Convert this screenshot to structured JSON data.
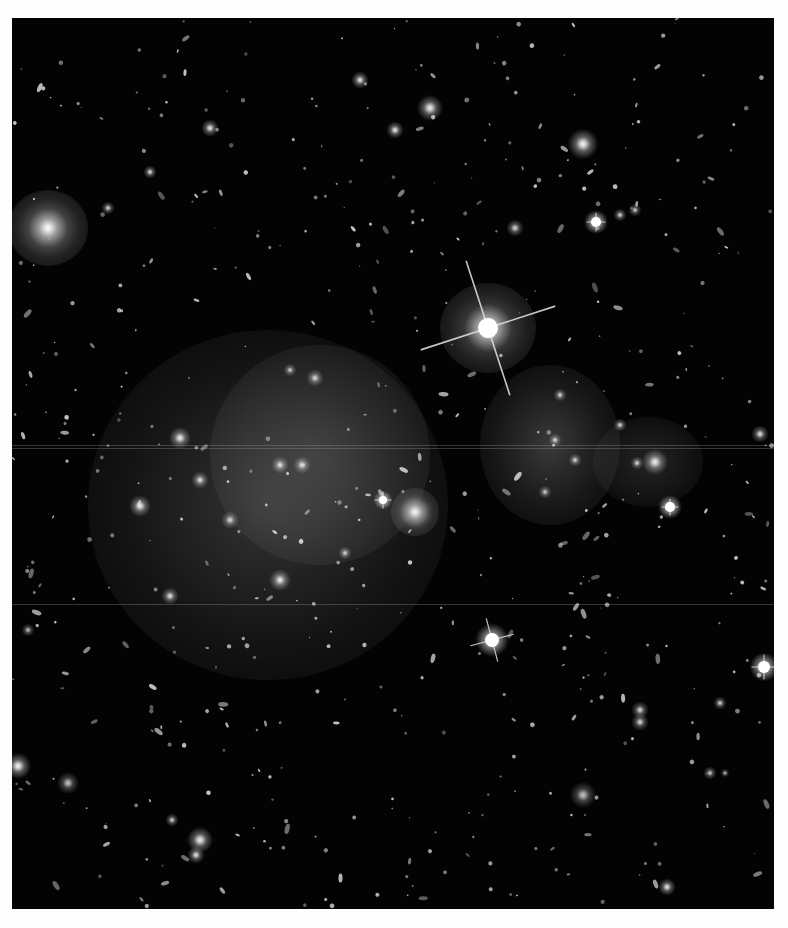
{
  "image": {
    "subject": "galaxy cluster deep-field photograph",
    "palette": "grayscale",
    "background_color": "#030303",
    "frame_color": "#fdfdfd",
    "bounds": {
      "left": 12,
      "top": 18,
      "width": 762,
      "height": 891
    }
  },
  "diffuse_glows": [
    {
      "name": "cluster-halo-left",
      "cx": 268,
      "cy": 505,
      "rx": 180,
      "ry": 175,
      "color": "rgba(120,120,120,0.42)"
    },
    {
      "name": "cluster-halo-left-core",
      "cx": 320,
      "cy": 455,
      "rx": 110,
      "ry": 110,
      "color": "rgba(140,140,140,0.30)"
    },
    {
      "name": "cluster-halo-right",
      "cx": 550,
      "cy": 445,
      "rx": 70,
      "ry": 80,
      "color": "rgba(140,140,140,0.40)"
    },
    {
      "name": "cluster-halo-far-right",
      "cx": 648,
      "cy": 462,
      "rx": 55,
      "ry": 45,
      "color": "rgba(110,110,110,0.30)"
    },
    {
      "name": "bright-star-halo",
      "cx": 488,
      "cy": 328,
      "rx": 48,
      "ry": 45,
      "color": "rgba(200,200,200,0.45)"
    },
    {
      "name": "galaxy-halo-left-edge",
      "cx": 48,
      "cy": 228,
      "rx": 40,
      "ry": 38,
      "color": "rgba(220,220,220,0.55)"
    },
    {
      "name": "galaxy-halo-center",
      "cx": 415,
      "cy": 512,
      "rx": 24,
      "ry": 24,
      "color": "rgba(210,210,210,0.55)"
    }
  ],
  "streaks": [
    {
      "y": 445
    },
    {
      "y": 448
    },
    {
      "y": 604
    }
  ],
  "spiked_stars": [
    {
      "name": "bright-star-main",
      "x": 488,
      "y": 328,
      "r": 10,
      "spike": 70,
      "angle": -18
    },
    {
      "name": "bright-star-lower",
      "x": 492,
      "y": 640,
      "r": 7,
      "spike": 22,
      "angle": -15
    },
    {
      "name": "bright-star-right-edge",
      "x": 764,
      "y": 667,
      "r": 6,
      "spike": 12,
      "angle": 0
    },
    {
      "name": "star-upper-right",
      "x": 596,
      "y": 222,
      "r": 5,
      "spike": 9,
      "angle": 0
    },
    {
      "name": "star-right-cluster",
      "x": 670,
      "y": 507,
      "r": 5,
      "spike": 8,
      "angle": 0
    },
    {
      "name": "star-cluster-mid",
      "x": 383,
      "y": 500,
      "r": 4,
      "spike": 8,
      "angle": 0
    }
  ],
  "bright_sources": [
    {
      "x": 48,
      "y": 228,
      "r": 9,
      "b": 1.0
    },
    {
      "x": 583,
      "y": 144,
      "r": 7,
      "b": 0.9
    },
    {
      "x": 415,
      "y": 512,
      "r": 7,
      "b": 0.9
    },
    {
      "x": 430,
      "y": 108,
      "r": 6,
      "b": 0.85
    },
    {
      "x": 360,
      "y": 80,
      "r": 4,
      "b": 0.8
    },
    {
      "x": 395,
      "y": 130,
      "r": 4,
      "b": 0.8
    },
    {
      "x": 210,
      "y": 128,
      "r": 4,
      "b": 0.8
    },
    {
      "x": 150,
      "y": 172,
      "r": 3,
      "b": 0.75
    },
    {
      "x": 108,
      "y": 208,
      "r": 3,
      "b": 0.7
    },
    {
      "x": 18,
      "y": 766,
      "r": 6,
      "b": 0.9
    },
    {
      "x": 68,
      "y": 783,
      "r": 5,
      "b": 0.6
    },
    {
      "x": 200,
      "y": 840,
      "r": 6,
      "b": 0.85
    },
    {
      "x": 172,
      "y": 820,
      "r": 3,
      "b": 0.7
    },
    {
      "x": 196,
      "y": 855,
      "r": 4,
      "b": 0.75
    },
    {
      "x": 667,
      "y": 887,
      "r": 4,
      "b": 0.8
    },
    {
      "x": 583,
      "y": 795,
      "r": 6,
      "b": 0.6
    },
    {
      "x": 640,
      "y": 710,
      "r": 4,
      "b": 0.7
    },
    {
      "x": 640,
      "y": 722,
      "r": 4,
      "b": 0.7
    },
    {
      "x": 720,
      "y": 703,
      "r": 3,
      "b": 0.7
    },
    {
      "x": 710,
      "y": 773,
      "r": 3,
      "b": 0.65
    },
    {
      "x": 725,
      "y": 773,
      "r": 2,
      "b": 0.6
    },
    {
      "x": 180,
      "y": 438,
      "r": 5,
      "b": 0.85
    },
    {
      "x": 140,
      "y": 506,
      "r": 5,
      "b": 0.85
    },
    {
      "x": 280,
      "y": 580,
      "r": 5,
      "b": 0.85
    },
    {
      "x": 200,
      "y": 480,
      "r": 4,
      "b": 0.75
    },
    {
      "x": 230,
      "y": 520,
      "r": 4,
      "b": 0.7
    },
    {
      "x": 280,
      "y": 465,
      "r": 4,
      "b": 0.75
    },
    {
      "x": 302,
      "y": 465,
      "r": 4,
      "b": 0.75
    },
    {
      "x": 170,
      "y": 596,
      "r": 4,
      "b": 0.75
    },
    {
      "x": 345,
      "y": 553,
      "r": 3,
      "b": 0.7
    },
    {
      "x": 290,
      "y": 370,
      "r": 3,
      "b": 0.65
    },
    {
      "x": 315,
      "y": 378,
      "r": 4,
      "b": 0.7
    },
    {
      "x": 655,
      "y": 462,
      "r": 6,
      "b": 0.85
    },
    {
      "x": 637,
      "y": 463,
      "r": 3,
      "b": 0.7
    },
    {
      "x": 620,
      "y": 425,
      "r": 3,
      "b": 0.7
    },
    {
      "x": 575,
      "y": 460,
      "r": 3,
      "b": 0.7
    },
    {
      "x": 555,
      "y": 440,
      "r": 3,
      "b": 0.7
    },
    {
      "x": 560,
      "y": 395,
      "r": 3,
      "b": 0.7
    },
    {
      "x": 545,
      "y": 492,
      "r": 3,
      "b": 0.65
    },
    {
      "x": 515,
      "y": 228,
      "r": 4,
      "b": 0.7
    },
    {
      "x": 620,
      "y": 215,
      "r": 3,
      "b": 0.7
    },
    {
      "x": 635,
      "y": 210,
      "r": 3,
      "b": 0.65
    },
    {
      "x": 760,
      "y": 434,
      "r": 4,
      "b": 0.75
    },
    {
      "x": 28,
      "y": 630,
      "r": 3,
      "b": 0.6
    }
  ],
  "faint_sources_seed": 20250101,
  "faint_sources_count": 520
}
